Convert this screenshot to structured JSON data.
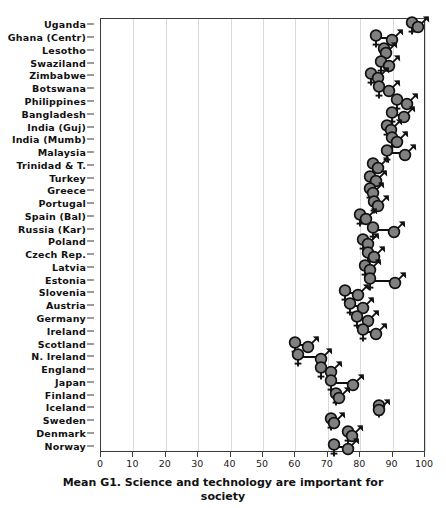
{
  "chart_data": {
    "type": "scatter",
    "title": "",
    "xlabel": "Mean G1. Science and technology are important for society",
    "ylabel": "",
    "xlim": [
      0,
      100
    ],
    "xticks": [
      0,
      10,
      20,
      30,
      40,
      50,
      60,
      70,
      80,
      90,
      100
    ],
    "xticklabels": [
      "0",
      "10",
      "20",
      "30",
      "40",
      "50",
      "60",
      "70",
      "80",
      "90",
      "100"
    ],
    "grid": "vertical",
    "legend": "none",
    "marker_symbols": {
      "female": "♀",
      "male": "♂"
    },
    "marker_color": "#808080",
    "marker_edge_color": "#111111",
    "connector_color": "#111111",
    "series": [
      {
        "name": "Female",
        "key": "female"
      },
      {
        "name": "Male",
        "key": "male"
      }
    ],
    "categories": [
      "Uganda",
      "Ghana (Centr)",
      "Lesotho",
      "Swaziland",
      "Zimbabwe",
      "Botswana",
      "Philippines",
      "Bangladesh",
      "India (Guj)",
      "India (Mumb)",
      "Malaysia",
      "Trinidad & T.",
      "Turkey",
      "Greece",
      "Portugal",
      "Spain (Bal)",
      "Russia (Kar)",
      "Poland",
      "Czech Rep.",
      "Latvia",
      "Estonia",
      "Slovenia",
      "Austria",
      "Germany",
      "Ireland",
      "Scotland",
      "N. Ireland",
      "England",
      "Japan",
      "Finland",
      "Iceland",
      "Sweden",
      "Denmark",
      "Norway"
    ],
    "rows": [
      {
        "country": "Uganda",
        "female": 96.5,
        "male": 98.5
      },
      {
        "country": "Ghana (Centr)",
        "female": 85.5,
        "male": 90.5
      },
      {
        "country": "Lesotho",
        "female": 88.0,
        "male": 88.5
      },
      {
        "country": "Swaziland",
        "female": 87.0,
        "male": 89.5
      },
      {
        "country": "Zimbabwe",
        "female": 84.0,
        "male": 86.0
      },
      {
        "country": "Botswana",
        "female": 86.5,
        "male": 89.5
      },
      {
        "country": "Philippines",
        "female": 92.0,
        "male": 95.0
      },
      {
        "country": "Bangladesh",
        "female": 90.5,
        "male": 94.0
      },
      {
        "country": "India (Guj)",
        "female": 89.0,
        "male": 90.0
      },
      {
        "country": "India (Mumb)",
        "female": 90.5,
        "male": 92.0
      },
      {
        "country": "Malaysia",
        "female": 89.0,
        "male": 94.5
      },
      {
        "country": "Trinidad & T.",
        "female": 84.5,
        "male": 86.0
      },
      {
        "country": "Turkey",
        "female": 83.5,
        "male": 85.5
      },
      {
        "country": "Greece",
        "female": 83.5,
        "male": 84.5
      },
      {
        "country": "Portugal",
        "female": 85.0,
        "male": 86.0
      },
      {
        "country": "Spain (Bal)",
        "female": 80.5,
        "male": 82.5
      },
      {
        "country": "Russia (Kar)",
        "female": 84.5,
        "male": 91.0
      },
      {
        "country": "Poland",
        "female": 81.5,
        "male": 83.0
      },
      {
        "country": "Czech Rep.",
        "female": 83.0,
        "male": 85.0
      },
      {
        "country": "Latvia",
        "female": 82.0,
        "male": 83.5
      },
      {
        "country": "Estonia",
        "female": 83.5,
        "male": 91.5
      },
      {
        "country": "Slovenia",
        "female": 76.0,
        "male": 80.0
      },
      {
        "country": "Austria",
        "female": 77.5,
        "male": 81.5
      },
      {
        "country": "Germany",
        "female": 79.5,
        "male": 83.0
      },
      {
        "country": "Ireland",
        "female": 81.5,
        "male": 85.5
      },
      {
        "country": "Scotland",
        "female": 60.5,
        "male": 64.5
      },
      {
        "country": "N. Ireland",
        "female": 61.5,
        "male": 68.5
      },
      {
        "country": "England",
        "female": 68.5,
        "male": 71.5
      },
      {
        "country": "Japan",
        "female": 71.5,
        "male": 78.5
      },
      {
        "country": "Finland",
        "female": 73.0,
        "male": 74.0
      },
      {
        "country": "Iceland",
        "female": 86.5,
        "male": 86.5
      },
      {
        "country": "Sweden",
        "female": 71.5,
        "male": 72.5
      },
      {
        "country": "Denmark",
        "female": 77.0,
        "male": 78.0
      },
      {
        "country": "Norway",
        "female": 72.5,
        "male": 77.0
      }
    ]
  }
}
